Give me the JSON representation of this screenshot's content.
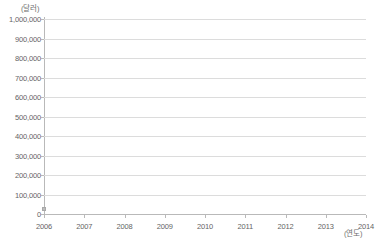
{
  "chart_data": {
    "type": "line",
    "title": "",
    "xlabel": "(연도)",
    "ylabel": "(달러)",
    "x": [
      2006,
      2007,
      2008,
      2009,
      2010,
      2011,
      2012,
      2013,
      2014
    ],
    "xtick_labels": [
      "2006",
      "2007",
      "2008",
      "2009",
      "2010",
      "2011",
      "2012",
      "2013",
      "2014"
    ],
    "ytick_labels": [
      "1,000,000",
      "900,000",
      "800,000",
      "700,000",
      "600,000",
      "500,000",
      "400,000",
      "300,000",
      "200,000",
      "100,000",
      "0"
    ],
    "ytick_values": [
      1000000,
      900000,
      800000,
      700000,
      600000,
      500000,
      400000,
      300000,
      200000,
      100000,
      0
    ],
    "ylim": [
      0,
      1000000
    ],
    "xlim": [
      2006,
      2014
    ],
    "grid": "horizontal",
    "legend": "none",
    "series": [
      {
        "name": "",
        "values": [
          25000
        ],
        "x": [
          2006
        ]
      }
    ],
    "colors": {
      "gridline": "#dcdcdc",
      "axis": "#b9b9b9",
      "tick_text": "#656565",
      "unit_text": "#6e6e6e",
      "marker": "#bdbdbd",
      "background": "#ffffff"
    }
  }
}
